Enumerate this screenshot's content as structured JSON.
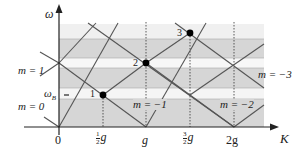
{
  "axes": {
    "y_label": "ω",
    "x_label": "K",
    "omega_B_label": "ω",
    "omega_B_subscript": "B"
  },
  "ticks": [
    {
      "id": "zero",
      "text": "0"
    },
    {
      "id": "half",
      "num": "1",
      "den": "2",
      "suffix": "g"
    },
    {
      "id": "g",
      "text": "g"
    },
    {
      "id": "three_half",
      "num": "3",
      "den": "2",
      "suffix": "g"
    },
    {
      "id": "two_g",
      "text": "2g"
    }
  ],
  "mode_labels": {
    "m1": "m = 1",
    "m0": "m = 0",
    "m_neg1": "m = −1",
    "m_neg2": "m = −2",
    "m_neg3": "m = −3"
  },
  "points": [
    {
      "label": "1"
    },
    {
      "label": "2"
    },
    {
      "label": "3"
    }
  ],
  "colors": {
    "band_light": "#f0f0f0",
    "band_dark": "#d4d4d4",
    "gap_white": "#fafafa",
    "line": "#555555",
    "axis": "#222222"
  }
}
